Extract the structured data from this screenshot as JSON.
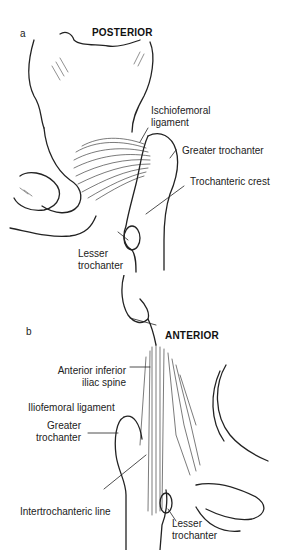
{
  "figure": {
    "panels": [
      {
        "letter": "a",
        "view": "POSTERIOR",
        "labels": {
          "ischiofemoral_1": "Ischiofemoral",
          "ischiofemoral_2": "ligament",
          "greater_trochanter": "Greater trochanter",
          "trochanteric_crest": "Trochanteric crest",
          "lesser_trochanter_1": "Lesser",
          "lesser_trochanter_2": "trochanter"
        }
      },
      {
        "letter": "b",
        "view": "ANTERIOR",
        "labels": {
          "aiis_1": "Anterior inferior",
          "aiis_2": "iliac spine",
          "iliofemoral": "Iliofemoral ligament",
          "greater_trochanter_1": "Greater",
          "greater_trochanter_2": "trochanter",
          "intertrochanteric": "Intertrochanteric line",
          "lesser_trochanter_1": "Lesser",
          "lesser_trochanter_2": "trochanter"
        }
      }
    ]
  }
}
